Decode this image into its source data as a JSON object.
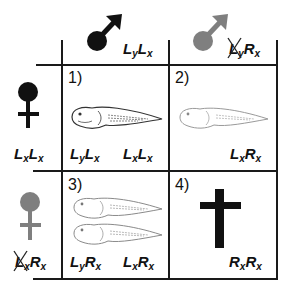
{
  "colors": {
    "ink": "#111111",
    "gray_symbol": "#7f7f7f",
    "tadpole_bold": "#333333",
    "tadpole_faint": "#9a9a9a"
  },
  "header": {
    "col1": {
      "symbol": "male-symbol",
      "symbol_color": "#111111",
      "genotype": {
        "a": "L",
        "a_sub": "y",
        "b": "L",
        "b_sub": "x"
      }
    },
    "col2": {
      "symbol": "male-symbol",
      "symbol_color": "#7f7f7f",
      "genotype": {
        "a": "L",
        "a_sub": "y",
        "a_struck": true,
        "b": "R",
        "b_sub": "x"
      }
    }
  },
  "rows": [
    {
      "symbol": "female-symbol",
      "symbol_color": "#111111",
      "genotype": {
        "a": "L",
        "a_sub": "x",
        "b": "L",
        "b_sub": "x"
      }
    },
    {
      "symbol": "female-symbol",
      "symbol_color": "#7f7f7f",
      "genotype": {
        "a": "L",
        "a_sub": "x",
        "a_struck": true,
        "b": "R",
        "b_sub": "x"
      }
    }
  ],
  "cells": [
    {
      "number": "1)",
      "content": "one bold tadpole",
      "offspring": [
        {
          "a": "L",
          "a_sub": "y",
          "b": "L",
          "b_sub": "x"
        },
        {
          "a": "L",
          "a_sub": "x",
          "b": "L",
          "b_sub": "x"
        }
      ]
    },
    {
      "number": "2)",
      "content": "one faint tadpole",
      "offspring": [
        {
          "a": "L",
          "a_sub": "x",
          "b": "R",
          "b_sub": "x"
        }
      ]
    },
    {
      "number": "3)",
      "content": "two faint tadpoles",
      "offspring": [
        {
          "a": "L",
          "a_sub": "y",
          "b": "R",
          "b_sub": "x"
        },
        {
          "a": "L",
          "a_sub": "x",
          "b": "R",
          "b_sub": "x"
        }
      ]
    },
    {
      "number": "4)",
      "content": "cross (lethal)",
      "offspring": [
        {
          "a": "R",
          "a_sub": "x",
          "b": "R",
          "b_sub": "x"
        }
      ]
    }
  ]
}
